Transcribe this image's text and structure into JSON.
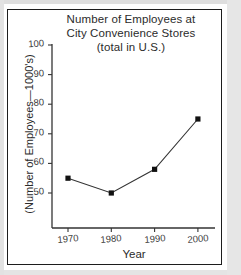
{
  "chart_data": {
    "type": "line",
    "title": "Number of Employees at City Convenience Stores (total in U.S.)",
    "title_lines": [
      "Number of Employees at",
      "City Convenience Stores",
      "(total in U.S.)"
    ],
    "xlabel": "Year",
    "ylabel": "(Number of Employees—1000's)",
    "categories": [
      1970,
      1980,
      1990,
      2000
    ],
    "x": [
      1970,
      1980,
      1990,
      2000
    ],
    "values": [
      55,
      50,
      58,
      75
    ],
    "xtick_labels": [
      "1970",
      "1980",
      "1990",
      "2000"
    ],
    "ytick_labels": [
      "50",
      "60",
      "70",
      "80",
      "90",
      "100"
    ],
    "yticks": [
      50,
      60,
      70,
      80,
      90,
      100
    ],
    "ylim": [
      45,
      100
    ],
    "xlim": [
      1965,
      2005
    ],
    "grid": false,
    "legend": false,
    "marker": "square",
    "marker_color": "#111111",
    "line_color": "#333333"
  },
  "colors": {
    "ink": "#1c1c1c",
    "text": "#2b2b2b",
    "axis": "#444444",
    "background": "#ffffff"
  }
}
